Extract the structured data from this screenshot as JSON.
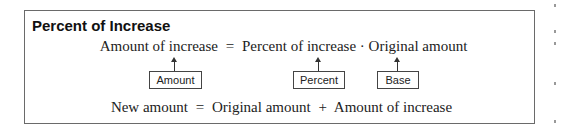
{
  "box": {
    "title": "Percent of Increase",
    "formula1": {
      "lhs": "Amount of increase",
      "eq": "=",
      "term1": "Percent of increase",
      "dot": "·",
      "term2": "Original amount"
    },
    "labels": [
      {
        "text": "Amount"
      },
      {
        "text": "Percent"
      },
      {
        "text": "Base"
      }
    ],
    "formula2": {
      "lhs": "New amount",
      "eq": "=",
      "term1": "Original amount",
      "plus": "+",
      "term2": "Amount of increase"
    }
  },
  "colors": {
    "border": "#6a6a6a",
    "text": "#222222"
  }
}
